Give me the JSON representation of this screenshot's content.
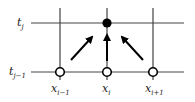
{
  "diagram": {
    "type": "finite-difference-stencil",
    "time_levels": [
      {
        "id": "tj",
        "base": "t",
        "sub": "j"
      },
      {
        "id": "tj-1",
        "base": "t",
        "sub": "j−1"
      }
    ],
    "space_points": [
      {
        "id": "xi-1",
        "base": "x",
        "sub": "i−1"
      },
      {
        "id": "xi",
        "base": "x",
        "sub": "i"
      },
      {
        "id": "xi+1",
        "base": "x",
        "sub": "i+1"
      }
    ],
    "nodes": [
      {
        "at": "x_i, t_j",
        "style": "filled"
      },
      {
        "at": "x_{i-1}, t_{j-1}",
        "style": "open"
      },
      {
        "at": "x_i, t_{j-1}",
        "style": "open"
      },
      {
        "at": "x_{i+1}, t_{j-1}",
        "style": "open"
      }
    ],
    "arrows": [
      {
        "from": "x_{i-1}, t_{j-1}",
        "to": "x_i, t_j"
      },
      {
        "from": "x_i, t_{j-1}",
        "to": "x_i, t_j"
      },
      {
        "from": "x_{i+1}, t_{j-1}",
        "to": "x_i, t_j"
      }
    ],
    "colors": {
      "line": "#333333",
      "node_fill": "#000000",
      "background": "#ffffff"
    }
  }
}
